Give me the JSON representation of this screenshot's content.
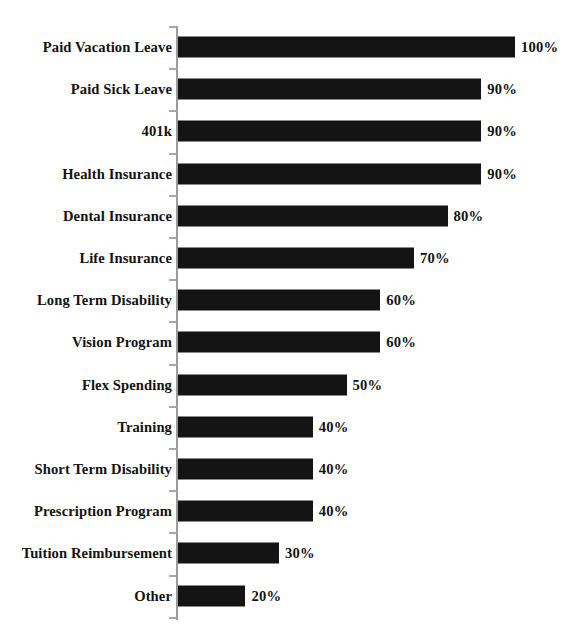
{
  "chart_data": {
    "type": "bar",
    "orientation": "horizontal",
    "title": "",
    "subtitle": "",
    "xlabel": "",
    "ylabel": "",
    "xlim": [
      0,
      100
    ],
    "grid": false,
    "legend": null,
    "value_suffix": "%",
    "categories": [
      "Paid Vacation Leave",
      "Paid Sick Leave",
      "401k",
      "Health Insurance",
      "Dental Insurance",
      "Life Insurance",
      "Long Term Disability",
      "Vision Program",
      "Flex Spending",
      "Training",
      "Short Term Disability",
      "Prescription Program",
      "Tuition Reimbursement",
      "Other"
    ],
    "values": [
      100,
      90,
      90,
      90,
      80,
      70,
      60,
      60,
      50,
      40,
      40,
      40,
      30,
      20
    ],
    "value_labels": [
      "100%",
      "90%",
      "90%",
      "90%",
      "80%",
      "70%",
      "60%",
      "60%",
      "50%",
      "40%",
      "40%",
      "40%",
      "30%",
      "20%"
    ],
    "bar_color": "#141414",
    "axis_color": "#9a9a9a",
    "text_color": "#121212",
    "background_color": "#ffffff"
  }
}
